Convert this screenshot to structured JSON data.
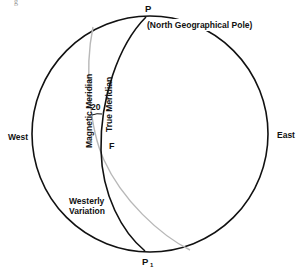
{
  "figure": {
    "tag": "g",
    "colors": {
      "ink": "#111111",
      "magnetic_line": "#b8b8b8",
      "background": "#ffffff"
    }
  },
  "labels": {
    "north_pole_letter": "P",
    "north_pole_desc": "(North Geographical Pole)",
    "south_pole_letter": "P",
    "south_pole_subscript": "1",
    "west": "West",
    "east": "East",
    "magnetic_meridian": "Magnetic Meridian",
    "true_meridian": "True Meridian",
    "angle": "20",
    "point_f": "F",
    "variation_line1": "Westerly",
    "variation_line2": "Variation"
  }
}
